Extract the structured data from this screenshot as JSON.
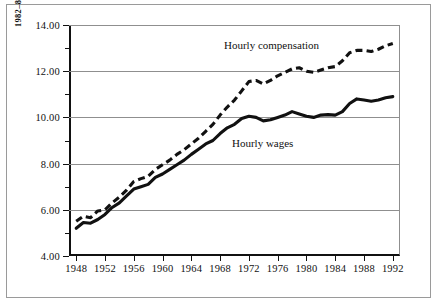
{
  "figure": {
    "axis_title": "1982–84 DOLLARS",
    "series_labels": {
      "compensation": "Hourly compensation",
      "wages": "Hourly wages"
    }
  },
  "colors": {
    "ink": "#111111",
    "grid": "#8f8f8f",
    "frame": "#9a9a9a",
    "background": "#ffffff"
  },
  "chart_data": {
    "type": "line",
    "title": "",
    "xlabel": "",
    "ylabel": "1982–84 DOLLARS",
    "xlim": [
      1947,
      1993
    ],
    "ylim": [
      4.0,
      14.0
    ],
    "grid": true,
    "legend": "inline-annotations",
    "y_ticks": [
      "4.00",
      "6.00",
      "8.00",
      "10.00",
      "12.00",
      "14.00"
    ],
    "y_tick_values": [
      4.0,
      6.0,
      8.0,
      10.0,
      12.0,
      14.0
    ],
    "y_minor_tick_values": [
      5.0,
      7.0,
      9.0,
      11.0,
      13.0
    ],
    "x_ticks": [
      "1948",
      "1952",
      "1956",
      "1960",
      "1964",
      "1968",
      "1972",
      "1976",
      "1980",
      "1984",
      "1988",
      "1992"
    ],
    "x_tick_values": [
      1948,
      1952,
      1956,
      1960,
      1964,
      1968,
      1972,
      1976,
      1980,
      1984,
      1988,
      1992
    ],
    "x": [
      1948,
      1949,
      1950,
      1951,
      1952,
      1953,
      1954,
      1955,
      1956,
      1957,
      1958,
      1959,
      1960,
      1961,
      1962,
      1963,
      1964,
      1965,
      1966,
      1967,
      1968,
      1969,
      1970,
      1971,
      1972,
      1973,
      1974,
      1975,
      1976,
      1977,
      1978,
      1979,
      1980,
      1981,
      1982,
      1983,
      1984,
      1985,
      1986,
      1987,
      1988,
      1989,
      1990,
      1991,
      1992
    ],
    "series": [
      {
        "name": "Hourly compensation",
        "style": "dashed",
        "values": [
          5.5,
          5.72,
          5.66,
          5.95,
          6.0,
          6.3,
          6.55,
          6.85,
          7.22,
          7.35,
          7.45,
          7.75,
          7.95,
          8.15,
          8.4,
          8.6,
          8.85,
          9.1,
          9.4,
          9.7,
          10.1,
          10.45,
          10.75,
          11.15,
          11.55,
          11.6,
          11.45,
          11.6,
          11.8,
          11.95,
          12.1,
          12.15,
          12.0,
          11.95,
          12.05,
          12.15,
          12.2,
          12.45,
          12.8,
          12.9,
          12.9,
          12.85,
          12.95,
          13.1,
          13.2
        ]
      },
      {
        "name": "Hourly wages",
        "style": "solid",
        "values": [
          5.2,
          5.45,
          5.42,
          5.58,
          5.8,
          6.1,
          6.3,
          6.6,
          6.9,
          7.0,
          7.1,
          7.4,
          7.55,
          7.75,
          7.95,
          8.15,
          8.4,
          8.62,
          8.85,
          9.0,
          9.3,
          9.55,
          9.7,
          9.95,
          10.05,
          10.0,
          9.85,
          9.9,
          10.0,
          10.1,
          10.25,
          10.15,
          10.05,
          10.0,
          10.1,
          10.12,
          10.1,
          10.25,
          10.6,
          10.8,
          10.75,
          10.7,
          10.75,
          10.85,
          10.9
        ]
      }
    ]
  }
}
